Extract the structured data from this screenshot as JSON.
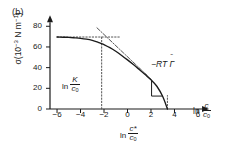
{
  "panel": {
    "label": "(b)"
  },
  "axes": {
    "ylabel_sigma": "σ(10",
    "ylabel_exp1": "−3",
    "ylabel_mid": " N m",
    "ylabel_exp2": "−1",
    "ylabel_close": ")",
    "xlabel_ln": "ln ",
    "xlabel_num": "c",
    "xlabel_den": "c",
    "xlabel_den_sub": "0",
    "xticks": [
      "−6",
      "−4",
      "−2",
      "0",
      "2",
      "4",
      "6"
    ],
    "yticks": [
      "0",
      "20",
      "40",
      "60",
      "80"
    ]
  },
  "annotations": {
    "k_ln": "ln ",
    "k_num": "K",
    "k_den": "c",
    "k_den_sub": "0",
    "cstar_ln": "ln ",
    "cstar_num": "c*",
    "cstar_den": "c",
    "cstar_den_sub": "0",
    "slope_prefix": "−RT ",
    "slope_gamma": "Γ",
    "slope_accent": "˜"
  },
  "colors": {
    "curve": "#1a1a1a",
    "axis": "#1a1a1a",
    "guide": "#555555",
    "background": "#ffffff"
  },
  "chart_data": {
    "type": "line",
    "title": "(b)",
    "xlabel": "ln c/c0",
    "ylabel": "sigma (10^-3 N m^-1)",
    "xlim": [
      -6.6,
      6.6
    ],
    "ylim": [
      0,
      88
    ],
    "xticks": [
      -6,
      -4,
      -2,
      0,
      2,
      4,
      6
    ],
    "yticks": [
      0,
      20,
      40,
      60,
      80
    ],
    "grid": false,
    "legend": null,
    "sigma_0": 70,
    "ln_K_over_c0": -2.2,
    "ln_cstar_over_c0": 3.4,
    "slope_label": "-RT Gamma-tilde",
    "series": [
      {
        "name": "surface tension isotherm",
        "style": "solid",
        "x": [
          -6.0,
          -5.5,
          -5.0,
          -4.5,
          -4.0,
          -3.5,
          -3.0,
          -2.5,
          -2.2,
          -2.0,
          -1.5,
          -1.0,
          -0.5,
          0.0,
          0.5,
          1.0,
          1.5,
          2.0,
          2.5,
          3.0,
          3.4
        ],
        "y": [
          69.6,
          69.4,
          69.2,
          68.8,
          68.3,
          67.5,
          66.3,
          64.5,
          63.2,
          62.2,
          59.3,
          55.8,
          51.8,
          47.5,
          43.0,
          38.2,
          33.3,
          28.2,
          22.0,
          12.0,
          0.0
        ]
      },
      {
        "name": "plateau guide line",
        "style": "dotted",
        "x": [
          -6.0,
          -0.6
        ],
        "y": [
          69.6,
          69.6
        ]
      },
      {
        "name": "ln K vertical guide",
        "style": "dotted",
        "x": [
          -2.2,
          -2.2
        ],
        "y": [
          0,
          71.0
        ]
      },
      {
        "name": "ln c* vertical guide",
        "style": "dotted",
        "x": [
          3.4,
          3.4
        ],
        "y": [
          0,
          13.0
        ]
      },
      {
        "name": "tangent dash-dot",
        "style": "dashdot",
        "x": [
          -2.6,
          2.0
        ],
        "y": [
          78.5,
          29.0
        ]
      },
      {
        "name": "slope triangle",
        "style": "solid",
        "x": [
          2.05,
          2.05,
          2.95
        ],
        "y": [
          27.5,
          12.5,
          12.5
        ]
      }
    ]
  }
}
